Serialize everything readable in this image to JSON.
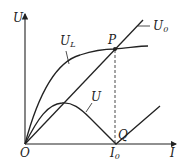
{
  "diagram": {
    "axes": {
      "y_label": "U",
      "x_label": "I",
      "origin_label": "O"
    },
    "curves": [
      {
        "id": "U_L",
        "label_main": "U",
        "label_sub": "L",
        "shape": "concave rising curve from origin, passes P, flattens"
      },
      {
        "id": "U_0",
        "label_main": "U",
        "label_sub": "0",
        "shape": "straight line from origin through P"
      },
      {
        "id": "U",
        "label_main": "U",
        "label_sub": "",
        "shape": "rises to a peak, falls to zero at Q, rises again linearly"
      }
    ],
    "points": [
      {
        "id": "P",
        "label": "P",
        "description": "intersection of U_L and U_0"
      },
      {
        "id": "Q",
        "label": "Q",
        "description": "zero of U at I_0"
      }
    ],
    "ticks": [
      {
        "label_main": "I",
        "label_sub": "0"
      }
    ],
    "guides": [
      {
        "description": "dashed vertical line from P down to I_0"
      }
    ],
    "colors": {
      "ink": "#222222",
      "background": "#ffffff"
    }
  }
}
